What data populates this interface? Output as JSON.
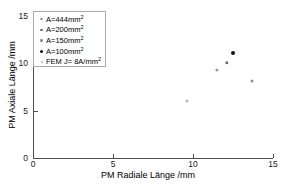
{
  "chart_data": {
    "type": "scatter",
    "title": "",
    "xlabel": "PM Radiale Länge /mm",
    "ylabel": "PM Axiale Länge /mm",
    "xlim": [
      0,
      15
    ],
    "ylim": [
      0,
      15
    ],
    "xticks": [
      0,
      5,
      10,
      15
    ],
    "yticks": [
      0,
      5,
      10,
      15
    ],
    "xtick_labels": [
      "0",
      "5",
      "10",
      "15"
    ],
    "ytick_labels": [
      "0",
      "5",
      "10",
      "15"
    ],
    "grid": false,
    "legend_position": "upper-left",
    "series": [
      {
        "name": "A=444mm²",
        "label_main": "A=444mm",
        "label_sup": "2",
        "marker_color": "#9a9a9a",
        "marker_size": 3.2,
        "legend_marker_size": 2.2,
        "points": [
          {
            "x": 11.5,
            "y": 9.3
          }
        ]
      },
      {
        "name": "A=200mm²",
        "label_main": "A=200mm",
        "label_sup": "2",
        "marker_color": "#6b6b6b",
        "marker_size": 3.4,
        "legend_marker_size": 2.4,
        "points": [
          {
            "x": 12.1,
            "y": 10.0
          }
        ]
      },
      {
        "name": "A=150mm²",
        "label_main": "A=150mm",
        "label_sup": "2",
        "marker_color": "#8f8f8f",
        "marker_size": 3.2,
        "legend_marker_size": 2.6,
        "points": [
          {
            "x": 13.7,
            "y": 8.1
          }
        ]
      },
      {
        "name": "A=100mm²",
        "label_main": "A=100mm",
        "label_sup": "2",
        "marker_color": "#121212",
        "marker_size": 4.0,
        "legend_marker_size": 3.0,
        "points": [
          {
            "x": 12.5,
            "y": 11.1
          }
        ]
      },
      {
        "name": "FEM J= 8A/mm²",
        "label_main": "FEM J= 8A/mm",
        "label_sup": "2",
        "marker_color": "#b4b4b4",
        "marker_size": 3.0,
        "legend_marker_size": 2.0,
        "points": [
          {
            "x": 9.6,
            "y": 6.0
          }
        ]
      }
    ]
  },
  "colors": {
    "axis": "#4d4d4d",
    "text": "#000000",
    "legend_border": "#aaaaaa",
    "background": "#ffffff"
  }
}
